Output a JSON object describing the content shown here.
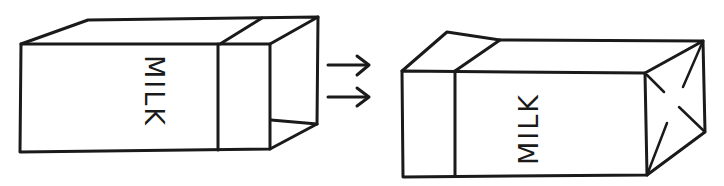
{
  "diagram": {
    "type": "line-drawing",
    "left_carton": {
      "label": "MILK",
      "state": "open end"
    },
    "arrows": {
      "count": 2,
      "direction": "right"
    },
    "right_carton": {
      "label": "MILK",
      "state": "folded closed end"
    },
    "colors": {
      "line": "#1a1a1a",
      "background": "#ffffff"
    }
  }
}
